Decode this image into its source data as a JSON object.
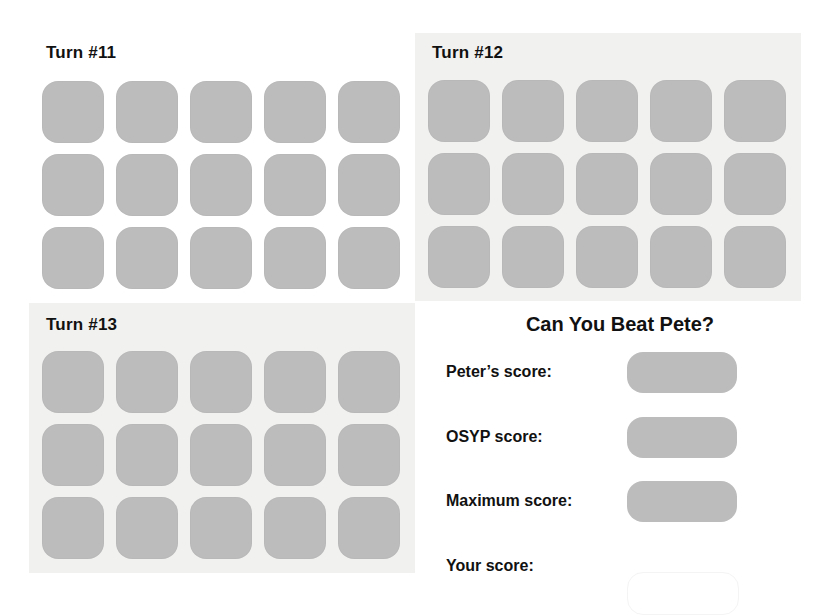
{
  "turns": [
    {
      "title": "Turn #11",
      "rows": 3,
      "cols": 5,
      "tile_state": "hidden",
      "shaded": false
    },
    {
      "title": "Turn #12",
      "rows": 3,
      "cols": 5,
      "tile_state": "hidden",
      "shaded": true
    },
    {
      "title": "Turn #13",
      "rows": 3,
      "cols": 5,
      "tile_state": "hidden",
      "shaded": true
    }
  ],
  "score_panel": {
    "title": "Can You Beat Pete?",
    "rows": [
      {
        "label": "Peter’s score:",
        "value": ""
      },
      {
        "label": "OSYP score:",
        "value": ""
      },
      {
        "label": "Maximum score:",
        "value": ""
      },
      {
        "label": "Your score:",
        "value": ""
      }
    ]
  },
  "colors": {
    "tile": "#bcbcbc",
    "panel_shade": "#f1f1f0",
    "background": "#ffffff",
    "text": "#111111"
  }
}
